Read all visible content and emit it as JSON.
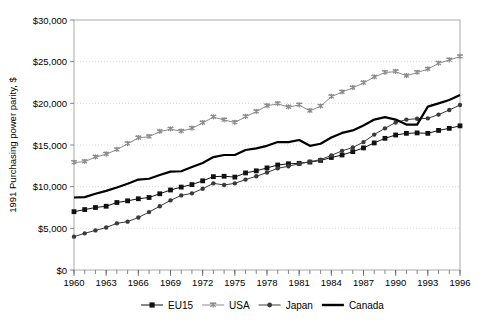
{
  "chart_data": {
    "type": "line",
    "title": "",
    "xlabel": "",
    "ylabel": "1991 Purchasing power parity, $",
    "xlim": [
      1960,
      1996
    ],
    "ylim": [
      0,
      30000
    ],
    "ytick_labels": [
      "$0",
      "$5,000",
      "$10,000",
      "$15,000",
      "$20,000",
      "$25,000",
      "$30,000"
    ],
    "ytick_values": [
      0,
      5000,
      10000,
      15000,
      20000,
      25000,
      30000
    ],
    "xtick_labels": [
      "1960",
      "1963",
      "1966",
      "1969",
      "1972",
      "1975",
      "1978",
      "1981",
      "1984",
      "1987",
      "1990",
      "1993",
      "1996"
    ],
    "xtick_values": [
      1960,
      1963,
      1966,
      1969,
      1972,
      1975,
      1978,
      1981,
      1984,
      1987,
      1990,
      1993,
      1996
    ],
    "minor_xticks_every": 1,
    "grid": "horizontal-dotted",
    "legend_position": "bottom",
    "x": [
      1960,
      1961,
      1962,
      1963,
      1964,
      1965,
      1966,
      1967,
      1968,
      1969,
      1970,
      1971,
      1972,
      1973,
      1974,
      1975,
      1976,
      1977,
      1978,
      1979,
      1980,
      1981,
      1982,
      1983,
      1984,
      1985,
      1986,
      1987,
      1988,
      1989,
      1990,
      1991,
      1992,
      1993,
      1994,
      1995,
      1996
    ],
    "series": [
      {
        "name": "EU15",
        "marker": "square",
        "color": "#111111",
        "values": [
          7000,
          7250,
          7500,
          7650,
          8100,
          8300,
          8550,
          8700,
          9150,
          9600,
          9950,
          10250,
          10700,
          11200,
          11250,
          11150,
          11650,
          11900,
          12250,
          12600,
          12750,
          12800,
          12950,
          13150,
          13500,
          13800,
          14200,
          14650,
          15250,
          15800,
          16200,
          16400,
          16450,
          16400,
          16750,
          17000,
          17300
        ]
      },
      {
        "name": "USA",
        "marker": "star",
        "color": "#8c8c8c",
        "values": [
          12900,
          13000,
          13550,
          13900,
          14450,
          15150,
          15850,
          16000,
          16600,
          16900,
          16650,
          17000,
          17650,
          18350,
          18000,
          17700,
          18400,
          19000,
          19700,
          19950,
          19550,
          19800,
          19100,
          19650,
          20800,
          21350,
          21850,
          22450,
          23150,
          23700,
          23800,
          23300,
          23700,
          24100,
          24800,
          25200,
          25600
        ]
      },
      {
        "name": "Japan",
        "marker": "circle",
        "color": "#3a3a3a",
        "values": [
          4000,
          4400,
          4750,
          5100,
          5600,
          5800,
          6300,
          6950,
          7650,
          8350,
          8950,
          9200,
          9750,
          10400,
          10200,
          10400,
          10850,
          11250,
          11700,
          12200,
          12450,
          12750,
          13000,
          13250,
          13750,
          14300,
          14700,
          15350,
          16250,
          17000,
          17700,
          18050,
          18150,
          18200,
          18650,
          19200,
          19800
        ]
      },
      {
        "name": "Canada",
        "marker": "none",
        "color": "#000000",
        "values": [
          8700,
          8750,
          9150,
          9500,
          9900,
          10350,
          10850,
          10950,
          11400,
          11800,
          11850,
          12350,
          12850,
          13550,
          13800,
          13800,
          14400,
          14600,
          14900,
          15350,
          15350,
          15600,
          14900,
          15150,
          15900,
          16450,
          16750,
          17350,
          18050,
          18350,
          18050,
          17450,
          17450,
          17750,
          18450,
          18650,
          19200
        ],
        "late_values_note": "1996 end value approximately 21,000",
        "values_override_end": [
          19600,
          20000,
          20400,
          21000
        ]
      }
    ],
    "legend": [
      {
        "label": "EU15",
        "marker": "square",
        "color": "#111111"
      },
      {
        "label": "USA",
        "marker": "star",
        "color": "#8c8c8c"
      },
      {
        "label": "Japan",
        "marker": "circle",
        "color": "#3a3a3a"
      },
      {
        "label": "Canada",
        "marker": "none",
        "color": "#000000"
      }
    ]
  }
}
